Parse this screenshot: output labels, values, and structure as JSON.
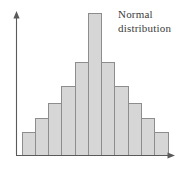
{
  "figure": {
    "background_color": "#ffffff",
    "width": 189,
    "height": 169
  },
  "annotation": {
    "line1": "Normal",
    "line2": "distribution",
    "color": "#3b3b3b"
  },
  "axes": {
    "x_axis_label": "",
    "y_axis_label": "",
    "axis_color": "#5a5a5a",
    "x_arrow_icon": "arrow-right-icon",
    "y_arrow_icon": "arrow-up-icon"
  },
  "style": {
    "bar_fill": "#d6d6d6",
    "bar_stroke": "#8d8d8d"
  },
  "chart_data": {
    "type": "bar",
    "title": "Normal distribution",
    "subtitle": "",
    "xlabel": "",
    "ylabel": "",
    "grid": false,
    "legend": "none",
    "annotations": [
      "Normal",
      "distribution"
    ],
    "categories": [
      "1",
      "2",
      "3",
      "4",
      "5",
      "6",
      "7",
      "8",
      "9",
      "10",
      "11"
    ],
    "tick_labels_x": [],
    "tick_labels_y": [],
    "values": [
      23,
      37,
      52,
      69,
      93,
      142,
      93,
      69,
      52,
      37,
      23
    ],
    "xlim": [
      0,
      11
    ],
    "ylim": [
      0,
      150
    ],
    "bar_count": 11,
    "symmetric": true,
    "peak_index": 5,
    "peak_value": 142
  }
}
